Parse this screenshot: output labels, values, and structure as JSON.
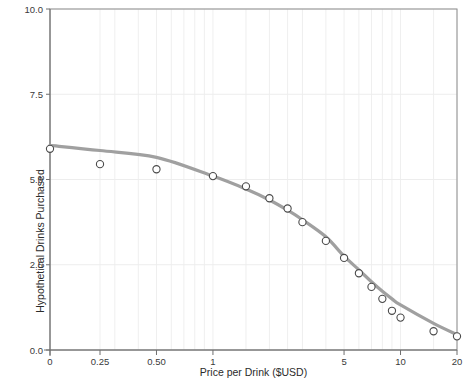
{
  "chart_data": {
    "type": "scatter",
    "title": "",
    "xlabel": "Price per Drink ($USD)",
    "ylabel": "Hypothetical Drinks Purchased",
    "x_scale": "log-like (0 then log10 from 0.25 to 20)",
    "xlim": [
      0,
      20
    ],
    "ylim": [
      0,
      10
    ],
    "grid": true,
    "legend": "none",
    "x_tick_labels": [
      "0",
      "0.25",
      "0.50",
      "1",
      "5",
      "10",
      "20"
    ],
    "x_tick_values": [
      0,
      0.25,
      0.5,
      1,
      5,
      10,
      20
    ],
    "y_tick_labels": [
      "0.0",
      "2.5",
      "5.0",
      "7.5",
      "10.0"
    ],
    "y_tick_values": [
      0,
      2.5,
      5,
      7.5,
      10
    ],
    "series": [
      {
        "name": "Observed mean demand",
        "marker": "open-circle",
        "color": "#4a4a4a",
        "x": [
          0,
          0.25,
          0.5,
          1,
          1.5,
          2,
          2.5,
          3,
          4,
          5,
          6,
          7,
          8,
          9,
          10,
          15,
          20
        ],
        "values": [
          5.9,
          5.45,
          5.3,
          5.1,
          4.8,
          4.45,
          4.15,
          3.75,
          3.2,
          2.7,
          2.25,
          1.85,
          1.5,
          1.15,
          0.95,
          0.55,
          0.4
        ]
      },
      {
        "name": "Fitted demand curve",
        "marker": "line",
        "color": "#a0a0a0",
        "x": [
          0,
          0.25,
          0.5,
          1,
          1.5,
          2,
          2.5,
          3,
          4,
          5,
          6,
          7,
          8,
          9,
          10,
          15,
          20
        ],
        "values": [
          6.0,
          5.85,
          5.65,
          5.1,
          4.72,
          4.4,
          4.1,
          3.82,
          3.32,
          2.75,
          2.35,
          2.0,
          1.72,
          1.5,
          1.32,
          0.78,
          0.45
        ]
      }
    ]
  },
  "axes": {
    "x_title": "Price per Drink ($USD)",
    "y_title": "Hypothetical Drinks Purchased"
  }
}
